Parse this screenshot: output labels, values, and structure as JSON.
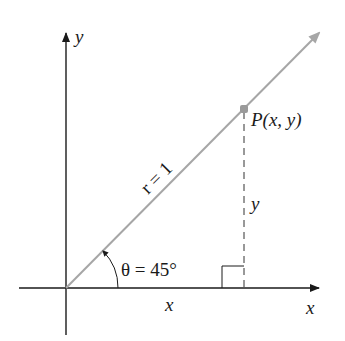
{
  "diagram": {
    "type": "unit-circle-angle",
    "axes": {
      "x_label": "x",
      "y_label": "y"
    },
    "ray": {
      "label": "r = 1",
      "color": "#a6a6a6"
    },
    "point": {
      "label": "P(x, y)",
      "color": "#9a9a9a"
    },
    "angle": {
      "label": "θ = 45°"
    },
    "segments": {
      "horizontal_label": "x",
      "vertical_label": "y"
    },
    "colors": {
      "axis": "#1a1a1a",
      "ray": "#a6a6a6",
      "dashed": "#333333"
    }
  }
}
